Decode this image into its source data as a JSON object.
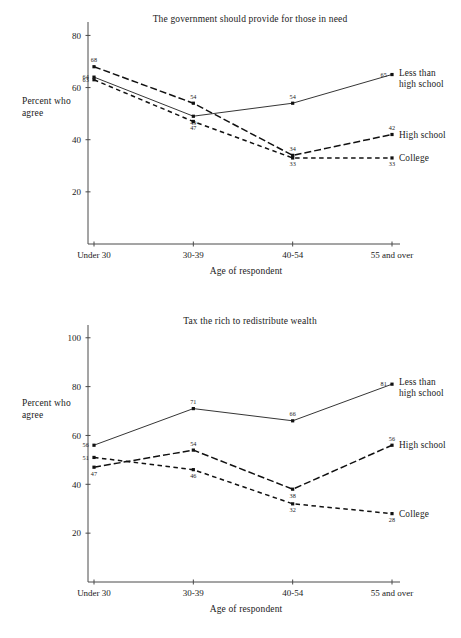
{
  "figure": {
    "background_color": "#ffffff",
    "ink_color": "#111111"
  },
  "chart_data": [
    {
      "id": "top",
      "type": "line",
      "title": "The government should provide for those in need",
      "xlabel": "Age of respondent",
      "ylabel_line1": "Percent who",
      "ylabel_line2": "agree",
      "categories": [
        "Under 30",
        "30-39",
        "40-54",
        "55 and over"
      ],
      "yticks": [
        20,
        40,
        60,
        80
      ],
      "ylim": [
        0,
        84
      ],
      "grid": false,
      "legend_position": "right-inline",
      "series": [
        {
          "name": "Less than high school",
          "name_line1": "Less than",
          "name_line2": "high school",
          "style": "solid",
          "values": [
            64,
            49,
            54,
            65
          ],
          "labels": [
            "64",
            "49",
            "54",
            "65"
          ],
          "label_pos": [
            "left",
            "below",
            "above",
            "left"
          ]
        },
        {
          "name": "High school",
          "name_line1": "High school",
          "name_line2": "",
          "style": "dash-dot",
          "values": [
            68,
            54,
            34,
            42
          ],
          "labels": [
            "68",
            "54",
            "34",
            "42"
          ],
          "label_pos": [
            "above",
            "above",
            "above",
            "above"
          ]
        },
        {
          "name": "College",
          "name_line1": "College",
          "name_line2": "",
          "style": "dashed",
          "values": [
            63,
            47,
            33,
            33
          ],
          "labels": [
            "63",
            "47",
            "33",
            "33"
          ],
          "label_pos": [
            "left",
            "below",
            "below",
            "below"
          ]
        }
      ]
    },
    {
      "id": "bottom",
      "type": "line",
      "title": "Tax the rich to redistribute wealth",
      "xlabel": "Age of respondent",
      "ylabel_line1": "Percent who",
      "ylabel_line2": "agree",
      "categories": [
        "Under 30",
        "30-39",
        "40-54",
        "55 and over"
      ],
      "yticks": [
        20,
        40,
        60,
        80,
        100
      ],
      "ylim": [
        0,
        104
      ],
      "grid": false,
      "legend_position": "right-inline",
      "series": [
        {
          "name": "Less than high school",
          "name_line1": "Less than",
          "name_line2": "high school",
          "style": "solid",
          "values": [
            56,
            71,
            66,
            81
          ],
          "labels": [
            "56",
            "71",
            "66",
            "81"
          ],
          "label_pos": [
            "left",
            "above",
            "above",
            "left"
          ]
        },
        {
          "name": "High school",
          "name_line1": "High school",
          "name_line2": "",
          "style": "dash-dot",
          "values": [
            47,
            54,
            38,
            56
          ],
          "labels": [
            "47",
            "54",
            "38",
            "56"
          ],
          "label_pos": [
            "below",
            "above",
            "below",
            "above"
          ]
        },
        {
          "name": "College",
          "name_line1": "College",
          "name_line2": "",
          "style": "dashed",
          "values": [
            51,
            46,
            32,
            28
          ],
          "labels": [
            "51",
            "46",
            "32",
            "28"
          ],
          "label_pos": [
            "left",
            "below",
            "below",
            "below"
          ]
        }
      ]
    }
  ]
}
